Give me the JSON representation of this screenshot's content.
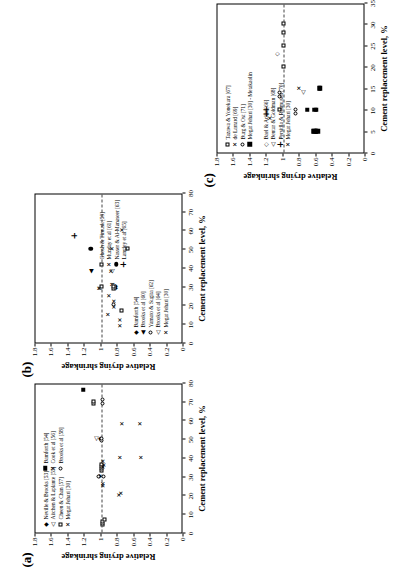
{
  "figure": {
    "axis_x_title": "Cement replacement level, %",
    "axis_y_title": "Relative drying shrinkage",
    "panel_a_label": "(a)",
    "panel_b_label": "(b)",
    "panel_c_label": "(c)"
  },
  "chart_data": [
    {
      "id": "a",
      "type": "scatter",
      "title": "(a)",
      "xlabel": "Cement replacement level, %",
      "ylabel": "Relative drying shrinkage",
      "xlim": [
        0,
        80
      ],
      "ylim": [
        0,
        1.8
      ],
      "xticks": [
        "0",
        "10",
        "20",
        "30",
        "40",
        "50",
        "60",
        "70",
        "80"
      ],
      "yticks": [
        "0",
        "0.2",
        "0.4",
        "0.6",
        "0.8",
        "1",
        "1.2",
        "1.4",
        "1.6",
        "1.8"
      ],
      "grid": false,
      "reference_line": {
        "y": 1.0,
        "style": "dashed"
      },
      "legend_position": "inside-upper-left",
      "series": [
        {
          "name": "Neville & Brooks [53]",
          "marker": "filled-diamond",
          "points": [
            [
              30,
              1.03
            ],
            [
              50,
              1.02
            ]
          ]
        },
        {
          "name": "Aitchen & Laplante [55]",
          "marker": "open-triangle",
          "points": [
            [
              50,
              1.07
            ]
          ]
        },
        {
          "name": "Cheen & Chan [57]",
          "marker": "open-square",
          "points": [
            [
              4,
              0.99
            ],
            [
              5,
              0.99
            ],
            [
              6,
              0.99
            ],
            [
              7,
              0.96
            ],
            [
              33,
              1.0
            ],
            [
              34,
              1.0
            ],
            [
              35,
              1.0
            ],
            [
              36,
              1.0
            ],
            [
              69,
              1.1
            ],
            [
              70,
              1.1
            ]
          ]
        },
        {
          "name": "Megat Johari [30]",
          "marker": "x",
          "points": [
            [
              20,
              0.79
            ],
            [
              21,
              0.77
            ],
            [
              35,
              0.98
            ],
            [
              36,
              0.97
            ],
            [
              38,
              0.98
            ],
            [
              40,
              0.78
            ],
            [
              40,
              0.52
            ],
            [
              58,
              0.76
            ],
            [
              58,
              0.53
            ]
          ]
        },
        {
          "name": "Bamforth [54]",
          "marker": "filled-square",
          "points": [
            [
              76,
              1.22
            ]
          ]
        },
        {
          "name": "Cook et al [56]",
          "marker": "x-bold",
          "points": [
            [
              25,
              0.99
            ],
            [
              26,
              0.99
            ]
          ]
        },
        {
          "name": "Brooks et al [58]",
          "marker": "open-circle",
          "points": [
            [
              30,
              1.03
            ],
            [
              30,
              0.97
            ],
            [
              49,
              1.0
            ],
            [
              50,
              1.0
            ],
            [
              69,
              0.98
            ],
            [
              71,
              0.98
            ]
          ]
        }
      ]
    },
    {
      "id": "b",
      "type": "scatter",
      "title": "(b)",
      "xlabel": "Cement replacement level, %",
      "ylabel": "Relative drying shrinkage",
      "xlim": [
        0,
        80
      ],
      "ylim": [
        0,
        1.8
      ],
      "xticks": [
        "0",
        "10",
        "20",
        "30",
        "40",
        "50",
        "60",
        "70",
        "80"
      ],
      "yticks": [
        "0",
        "0.2",
        "0.4",
        "0.6",
        "0.8",
        "1",
        "1.2",
        "1.4",
        "1.6",
        "1.8"
      ],
      "grid": false,
      "reference_line": {
        "y": 1.0,
        "style": "dashed"
      },
      "legend_position": "inside-lower",
      "series": [
        {
          "name": "Bamforth [54]",
          "marker": "filled-diamond",
          "points": [
            [
              29,
              0.84
            ],
            [
              30,
              0.84
            ]
          ]
        },
        {
          "name": "Brooks et al [60]",
          "marker": "filled-triangle",
          "points": [
            [
              38,
              1.13
            ]
          ]
        },
        {
          "name": "Yamato & Sugita [62]",
          "marker": "open-circle",
          "points": [
            [
              20,
              0.85
            ]
          ]
        },
        {
          "name": "Brooks et al [64]",
          "marker": "open-triangle",
          "points": [
            [
              38,
              0.88
            ]
          ]
        },
        {
          "name": "Megat Johari [30]",
          "marker": "x-bold",
          "points": [
            [
              9,
              0.78
            ],
            [
              12,
              0.78
            ],
            [
              15,
              0.93
            ],
            [
              19,
              0.85
            ],
            [
              22,
              0.85
            ],
            [
              25,
              0.91
            ],
            [
              29,
              1.02
            ],
            [
              31,
              0.86
            ],
            [
              31,
              0.88
            ],
            [
              38,
              0.89
            ]
          ]
        },
        {
          "name": "Ghosh & Timusk [59]",
          "marker": "open-square",
          "points": [
            [
              17,
              0.76
            ],
            [
              29,
              0.85
            ],
            [
              30,
              0.85
            ],
            [
              30,
              1.0
            ],
            [
              50,
              0.68
            ]
          ]
        },
        {
          "name": "Munday et al [61]",
          "marker": "x",
          "points": [
            [
              29,
              1.03
            ],
            [
              50,
              0.87
            ],
            [
              60,
              0.75
            ]
          ]
        },
        {
          "name": "Nasser & Al-Manaseer [63]",
          "marker": "filled-circle",
          "points": [
            [
              50,
              1.13
            ]
          ]
        },
        {
          "name": "Langley et al [65]",
          "marker": "plus",
          "points": [
            [
              57,
              1.33
            ]
          ]
        }
      ]
    },
    {
      "id": "c",
      "type": "scatter",
      "title": "(c)",
      "xlabel": "Cement replacement level, %",
      "ylabel": "Relative drying shrinkage",
      "xlim": [
        0,
        35
      ],
      "ylim": [
        0,
        1.8
      ],
      "xticks": [
        "0",
        "5",
        "10",
        "15",
        "20",
        "25",
        "30",
        "35"
      ],
      "yticks": [
        "0",
        "0.2",
        "0.4",
        "0.6",
        "0.8",
        "1",
        "1.2",
        "1.4",
        "1.6",
        "1.8"
      ],
      "grid": false,
      "reference_line": {
        "y": 1.0,
        "style": "dashed"
      },
      "legend_position": "inside-upper-left",
      "series": [
        {
          "name": "Tazawa & Yonekura [67]",
          "marker": "open-square",
          "points": [
            [
              10,
              1.05
            ],
            [
              20,
              1.0
            ],
            [
              25,
              1.0
            ],
            [
              28,
              1.0
            ],
            [
              30,
              1.0
            ]
          ]
        },
        {
          "name": "de Larrard [69]",
          "marker": "x",
          "points": [
            [
              8,
              1.17
            ],
            [
              15,
              0.82
            ]
          ]
        },
        {
          "name": "Burg & Ost [71]",
          "marker": "open-circle",
          "points": [
            [
              9,
              0.85
            ],
            [
              10,
              0.85
            ],
            [
              13,
              1.05
            ],
            [
              14,
              1.05
            ]
          ]
        },
        {
          "name": "Megat Johari [30] - Metakaolin",
          "marker": "filled-square",
          "points": [
            [
              5,
              0.62
            ],
            [
              5,
              0.6
            ],
            [
              5,
              0.58
            ],
            [
              5,
              0.63
            ],
            [
              10,
              0.71
            ],
            [
              10,
              0.6
            ],
            [
              10,
              0.62
            ],
            [
              15,
              0.56
            ],
            [
              15,
              0.55
            ]
          ]
        },
        {
          "name": "Bael & Acker [66]",
          "marker": "open-diamond",
          "points": [
            [
              23,
              1.08
            ]
          ]
        },
        {
          "name": "Bentur & Goldman [68]",
          "marker": "open-triangle",
          "points": [
            [
              14,
              0.77
            ]
          ]
        },
        {
          "name": "Persitlla & Rasmusen [70]",
          "marker": "plus",
          "points": [
            [
              9,
              1.2
            ],
            [
              10,
              1.2
            ]
          ]
        }
      ]
    }
  ],
  "panel_a": {
    "legend_group_1": [
      {
        "marker": "filled-diamond",
        "label": "Neville & Brooks [53]"
      },
      {
        "marker": "open-triangle",
        "label": "Aitchen & Laplante [55]"
      },
      {
        "marker": "open-square",
        "label": "Cheen & Chan [57]"
      },
      {
        "marker": "x",
        "label": "Megat Johari [30]"
      }
    ],
    "legend_group_2": [
      {
        "marker": "filled-square",
        "label": "Bamforth [54]"
      },
      {
        "marker": "x",
        "label": "Cook et al [56]"
      },
      {
        "marker": "open-circle",
        "label": "Brooks et al [58]"
      }
    ]
  },
  "panel_b": {
    "legend_group_1": [
      {
        "marker": "filled-diamond",
        "label": "Bamforth [54]"
      },
      {
        "marker": "filled-triangle",
        "label": "Brooks et al [60]"
      },
      {
        "marker": "open-circle",
        "label": "Yamato & Sugita [62]"
      },
      {
        "marker": "open-triangle",
        "label": "Brooks et al [64]"
      },
      {
        "marker": "x",
        "label": "Megat Johari [30]"
      }
    ],
    "legend_group_2": [
      {
        "marker": "open-square",
        "label": "Ghosh & Timusk [59]"
      },
      {
        "marker": "x",
        "label": "Munday et al [61]"
      },
      {
        "marker": "filled-circle",
        "label": "Nasser & Al-Manaseer [63]"
      },
      {
        "marker": "plus",
        "label": "Langley et al [65]"
      }
    ]
  },
  "panel_c": {
    "legend_group_1": [
      {
        "marker": "open-square",
        "label": "Tazawa & Yonekura [67]"
      },
      {
        "marker": "x",
        "label": "de Larrard [69]"
      },
      {
        "marker": "open-circle",
        "label": "Burg & Ost [71]"
      },
      {
        "marker": "filled-square",
        "label": "Megat Johari [30] - Metakaolin"
      }
    ],
    "legend_group_2": [
      {
        "marker": "open-diamond",
        "label": "Bael & Acker [66]"
      },
      {
        "marker": "open-triangle",
        "label": "Bentur & Goldman [68]"
      },
      {
        "marker": "plus",
        "label": "Persitlla & Rasmusen [70]"
      },
      {
        "marker": "x",
        "label": "Megat Johari [30]"
      }
    ]
  }
}
